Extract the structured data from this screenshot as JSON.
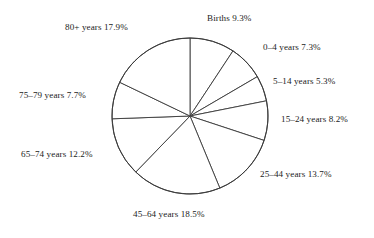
{
  "chart_data": {
    "type": "pie",
    "title": "",
    "subtitle": "",
    "xlabel": "",
    "ylabel": "",
    "legend_position": "none",
    "grid": false,
    "start_angle_deg": 0,
    "direction": "clockwise",
    "units": "percent",
    "categories": [
      "Births",
      "0–4 years",
      "5–14 years",
      "15–24 years",
      "25–44 years",
      "45–64 years",
      "65–74 years",
      "75–79 years",
      "80+ years"
    ],
    "values": [
      9.3,
      7.3,
      5.3,
      8.2,
      13.7,
      18.5,
      12.2,
      7.7,
      17.9
    ],
    "slices": [
      {
        "label": "Births 9.3%",
        "category": "Births",
        "value": 9.3,
        "value_text": "9.3%"
      },
      {
        "label": "0–4 years 7.3%",
        "category": "0–4 years",
        "value": 7.3,
        "value_text": "7.3%"
      },
      {
        "label": "5–14 years 5.3%",
        "category": "5–14 years",
        "value": 5.3,
        "value_text": "5.3%"
      },
      {
        "label": "15–24 years 8.2%",
        "category": "15–24 years",
        "value": 8.2,
        "value_text": "8.2%"
      },
      {
        "label": "25–44 years 13.7%",
        "category": "25–44 years",
        "value": 13.7,
        "value_text": "13.7%"
      },
      {
        "label": "45–64 years 18.5%",
        "category": "45–64 years",
        "value": 18.5,
        "value_text": "18.5%"
      },
      {
        "label": "65–74 years 12.2%",
        "category": "65–74 years",
        "value": 12.2,
        "value_text": "12.2%"
      },
      {
        "label": "75–79 years 7.7%",
        "category": "75–79 years",
        "value": 7.7,
        "value_text": "7.7%"
      },
      {
        "label": "80+ years 17.9%",
        "category": "80+ years",
        "value": 17.9,
        "value_text": "17.9%"
      }
    ],
    "colors": {
      "slice_fill": "#ffffff",
      "slice_stroke": "#3a3a3a",
      "text": "#1b1b1b",
      "background": "#ffffff"
    }
  }
}
